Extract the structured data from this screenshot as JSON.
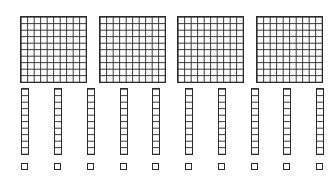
{
  "diagram": {
    "type": "base-ten-blocks",
    "line_color": "#2b2b2b",
    "background_color": "#ffffff",
    "hundreds": {
      "label": "hundreds flats",
      "count": 4,
      "grid": "10x10",
      "positions": [
        {
          "x": 20,
          "y": 16
        },
        {
          "x": 99,
          "y": 16
        },
        {
          "x": 177,
          "y": 16
        },
        {
          "x": 256,
          "y": 16
        }
      ]
    },
    "tens": {
      "label": "tens rods",
      "count": 10,
      "grid": "1x10",
      "positions": [
        {
          "x": 21,
          "y": 88
        },
        {
          "x": 54,
          "y": 88
        },
        {
          "x": 87,
          "y": 88
        },
        {
          "x": 120,
          "y": 88
        },
        {
          "x": 152,
          "y": 88
        },
        {
          "x": 185,
          "y": 88
        },
        {
          "x": 218,
          "y": 88
        },
        {
          "x": 251,
          "y": 88
        },
        {
          "x": 283,
          "y": 88
        },
        {
          "x": 316,
          "y": 88
        }
      ]
    },
    "ones": {
      "label": "unit cubes",
      "count": 10,
      "grid": "1x1",
      "positions": [
        {
          "x": 21,
          "y": 163
        },
        {
          "x": 54,
          "y": 163
        },
        {
          "x": 87,
          "y": 163
        },
        {
          "x": 120,
          "y": 163
        },
        {
          "x": 152,
          "y": 163
        },
        {
          "x": 185,
          "y": 163
        },
        {
          "x": 218,
          "y": 163
        },
        {
          "x": 251,
          "y": 163
        },
        {
          "x": 283,
          "y": 163
        },
        {
          "x": 316,
          "y": 163
        }
      ]
    }
  }
}
